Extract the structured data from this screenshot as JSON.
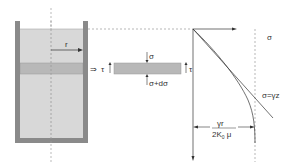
{
  "diagram": {
    "type": "silo-stress-diagram",
    "labels": {
      "radius": "r",
      "shear_arrow": "⇒",
      "tau_left": "τ",
      "tau_right": "τ",
      "sigma_top": "σ",
      "sigma_bottom": "σ+dσ",
      "axis_sigma": "σ",
      "line_label": "σ=γz",
      "asymptote_numerator": "γr",
      "asymptote_denominator": "2K",
      "asymptote_subscript": "0",
      "asymptote_mu": " μ"
    },
    "colors": {
      "wall": "#8a8a8a",
      "fill": "#d8d8d8",
      "band": "#b8b8b8",
      "line": "#333333",
      "dashed": "#888888"
    }
  }
}
